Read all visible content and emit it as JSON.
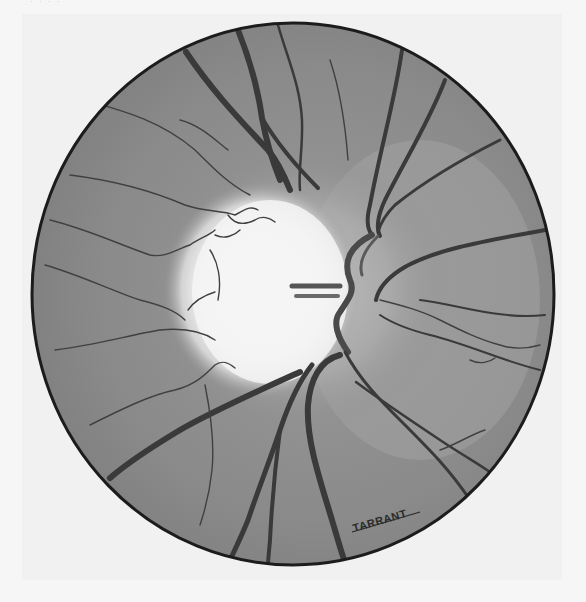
{
  "figure": {
    "type": "illustration",
    "caption_fragment": "· ·   ·   ·",
    "signature": "TARRANT",
    "colors": {
      "paper": "#f6f6f6",
      "retina": "#8c8c8c",
      "retina_light": "#a8a8a8",
      "disc": "#f4f4f4",
      "vessel": "#3c3c3c",
      "border": "#1c1c1c"
    }
  }
}
